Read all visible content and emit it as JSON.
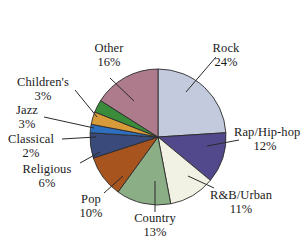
{
  "chart_data": {
    "type": "pie",
    "title": "",
    "subtitle": "",
    "xlabel": "",
    "ylabel": "",
    "legend_position": "none",
    "grid": false,
    "total_percent": 100,
    "categories": [
      "Rock",
      "Rap/Hip-hop",
      "R&B/Urban",
      "Country",
      "Pop",
      "Religious",
      "Classical",
      "Jazz",
      "Children's",
      "Other"
    ],
    "values": [
      24,
      12,
      11,
      13,
      10,
      6,
      2,
      3,
      3,
      16
    ],
    "value_labels": [
      "24%",
      "12%",
      "11%",
      "13%",
      "10%",
      "6%",
      "2%",
      "3%",
      "3%",
      "16%"
    ],
    "colors": [
      "#c3cadd",
      "#52488c",
      "#f2f2e4",
      "#8bae86",
      "#a8541f",
      "#3a4a7a",
      "#2f6fc0",
      "#d89b3a",
      "#3a8c3a",
      "#ad7b8c"
    ],
    "slices": [
      {
        "label": "Rock",
        "percent": 24,
        "percent_label": "24%",
        "color": "#c3cadd"
      },
      {
        "label": "Rap/Hip-hop",
        "percent": 12,
        "percent_label": "12%",
        "color": "#52488c"
      },
      {
        "label": "R&B/Urban",
        "percent": 11,
        "percent_label": "11%",
        "color": "#f2f2e4"
      },
      {
        "label": "Country",
        "percent": 13,
        "percent_label": "13%",
        "color": "#8bae86"
      },
      {
        "label": "Pop",
        "percent": 10,
        "percent_label": "10%",
        "color": "#a8541f"
      },
      {
        "label": "Religious",
        "percent": 6,
        "percent_label": "6%",
        "color": "#3a4a7a"
      },
      {
        "label": "Classical",
        "percent": 2,
        "percent_label": "2%",
        "color": "#2f6fc0"
      },
      {
        "label": "Jazz",
        "percent": 3,
        "percent_label": "3%",
        "color": "#d89b3a"
      },
      {
        "label": "Children's",
        "percent": 3,
        "percent_label": "3%",
        "color": "#3a8c3a"
      },
      {
        "label": "Other",
        "percent": 16,
        "percent_label": "16%",
        "color": "#ad7b8c"
      }
    ]
  },
  "style": {
    "slice_border_color": "#2b2b2b",
    "leader_line_color": "#2b2b2b",
    "text_color": "#1a1a1a",
    "background": "#ffffff"
  }
}
